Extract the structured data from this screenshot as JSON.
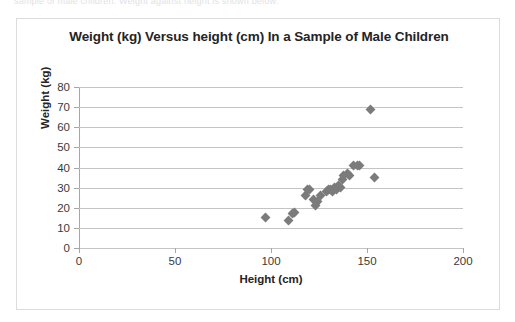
{
  "scan_artifact": {
    "text": "sample of male children. Weight against height is shown below."
  },
  "chart_data": {
    "type": "scatter",
    "title": "Weight (kg) Versus height (cm) In a Sample of Male Children",
    "xlabel": "Height (cm)",
    "ylabel": "Weight (kg)",
    "xlim": [
      0,
      200
    ],
    "ylim": [
      0,
      80
    ],
    "xticks": [
      0,
      50,
      100,
      150,
      200
    ],
    "yticks": [
      0,
      10,
      20,
      30,
      40,
      50,
      60,
      70,
      80
    ],
    "grid": "horizontal",
    "legend": "none",
    "marker": "diamond",
    "marker_color": "#7b7b7b",
    "series": [
      {
        "name": "Male children",
        "points": [
          [
            97,
            15
          ],
          [
            109,
            13.5
          ],
          [
            111,
            17
          ],
          [
            112,
            17.5
          ],
          [
            118,
            26
          ],
          [
            119,
            29
          ],
          [
            120,
            29
          ],
          [
            122,
            24
          ],
          [
            123,
            21
          ],
          [
            124,
            23
          ],
          [
            126,
            26
          ],
          [
            129,
            28
          ],
          [
            130,
            29
          ],
          [
            131,
            29
          ],
          [
            132,
            28
          ],
          [
            133,
            30
          ],
          [
            134,
            29
          ],
          [
            135,
            31
          ],
          [
            136,
            30
          ],
          [
            137,
            34
          ],
          [
            138,
            36
          ],
          [
            140,
            37
          ],
          [
            141,
            36
          ],
          [
            143,
            41
          ],
          [
            145,
            41
          ],
          [
            146,
            41
          ],
          [
            152,
            69
          ],
          [
            154,
            35
          ]
        ]
      }
    ]
  }
}
